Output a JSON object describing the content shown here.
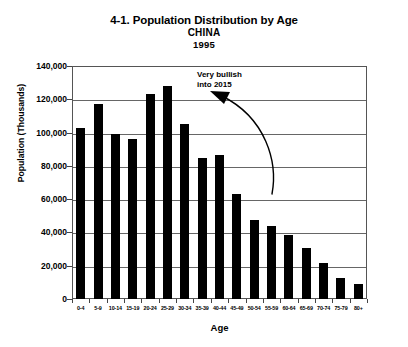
{
  "chart_data": {
    "type": "bar",
    "title": "4-1. Population Distribution by Age",
    "subtitle": "CHINA",
    "year": "1995",
    "xlabel": "Age",
    "ylabel": "Population (Thousands)",
    "ylim": [
      0,
      140000
    ],
    "ytick_labels": [
      "140,000",
      "120,000",
      "100,000",
      "80,000",
      "60,000",
      "40,000",
      "20,000",
      "0"
    ],
    "ytick_values": [
      140000,
      120000,
      100000,
      80000,
      60000,
      40000,
      20000,
      0
    ],
    "grid": true,
    "legend": "none",
    "bar_color": "#000000",
    "categories": [
      "0-4",
      "5-9",
      "10-14",
      "15-19",
      "20-24",
      "25-29",
      "30-34",
      "35-39",
      "40-44",
      "45-49",
      "50-54",
      "55-59",
      "60-64",
      "65-69",
      "70-74",
      "75-79",
      "80+"
    ],
    "values": [
      103000,
      117000,
      99000,
      96000,
      123000,
      128000,
      105000,
      85000,
      86500,
      63000,
      47500,
      44000,
      38500,
      30500,
      21500,
      12500,
      9000
    ],
    "annotations": [
      {
        "text_line1": "Very bullish",
        "text_line2": "into 2015",
        "arrow": "curved-arrow-pointing-left"
      }
    ]
  }
}
